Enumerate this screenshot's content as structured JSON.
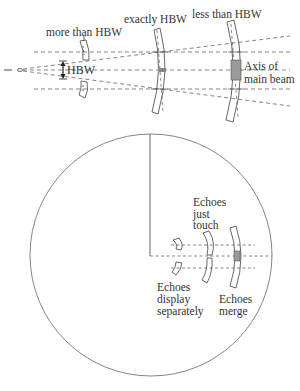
{
  "top_diagram": {
    "labels": {
      "more_than_hbw": "more than HBW",
      "exactly_hbw": "exactly HBW",
      "less_than_hbw": "less than HBW",
      "hbw": "HBW",
      "axis_line1": "Axis of",
      "axis_line2": "main beam"
    },
    "cases": [
      {
        "label": "more than HBW",
        "separation": "more"
      },
      {
        "label": "exactly HBW",
        "separation": "exact"
      },
      {
        "label": "less than HBW",
        "separation": "less"
      }
    ]
  },
  "bottom_diagram": {
    "shape": "PPI display circle",
    "labels": {
      "just_touch_1": "Echoes",
      "just_touch_2": "just",
      "just_touch_3": "touch",
      "separate_1": "Echoes",
      "separate_2": "display",
      "separate_3": "separately",
      "merge_1": "Echoes",
      "merge_2": "merge"
    }
  },
  "colors": {
    "line": "#555555",
    "dash": "#666666",
    "shade": "#9a9a9a",
    "background": "#ffffff"
  }
}
